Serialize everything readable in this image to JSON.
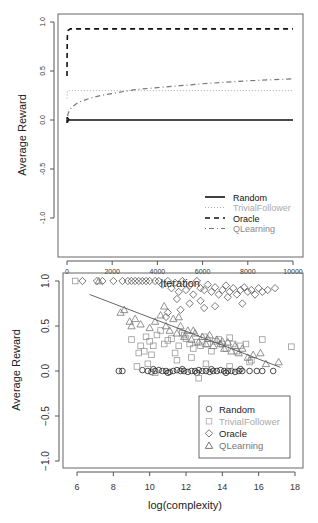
{
  "chart_data": [
    {
      "type": "line",
      "title": "",
      "xlabel": "Iteration",
      "ylabel": "Average Reward",
      "xlim": [
        0,
        10000
      ],
      "ylim": [
        -1.0,
        1.0
      ],
      "xticks": [
        0,
        2000,
        4000,
        6000,
        8000,
        10000
      ],
      "xtick_labels": [
        "0",
        "2000",
        "4000",
        "6000",
        "8000",
        "10000"
      ],
      "yticks": [
        -1.0,
        -0.5,
        0.0,
        0.5,
        1.0
      ],
      "ytick_labels": [
        "-1.0",
        "-0.5",
        "0.0",
        "0.5",
        "1.0"
      ],
      "grid": false,
      "legend_position": "bottom-right",
      "series": [
        {
          "name": "Random",
          "style": "solid",
          "color": "#111111",
          "x": [
            0,
            10,
            30,
            60,
            100,
            200,
            500,
            1000,
            2000,
            4000,
            6000,
            8000,
            10000
          ],
          "y": [
            -0.03,
            0.03,
            -0.02,
            0.01,
            0.0,
            0.0,
            0.0,
            0.0,
            0.0,
            0.0,
            0.0,
            0.0,
            0.0
          ]
        },
        {
          "name": "TrivialFollower",
          "style": "dotted",
          "color": "#aaaaaa",
          "x": [
            0,
            10,
            30,
            100,
            500,
            1000,
            2000,
            4000,
            6000,
            8000,
            10000
          ],
          "y": [
            0.22,
            0.27,
            0.3,
            0.3,
            0.3,
            0.3,
            0.3,
            0.3,
            0.3,
            0.3,
            0.3
          ]
        },
        {
          "name": "Oracle",
          "style": "dashed",
          "color": "#111111",
          "x": [
            0,
            5,
            10,
            20,
            40,
            80,
            150,
            300,
            1000,
            2000,
            4000,
            6000,
            8000,
            10000
          ],
          "y": [
            0.45,
            0.65,
            0.8,
            0.88,
            0.91,
            0.92,
            0.93,
            0.93,
            0.93,
            0.93,
            0.93,
            0.93,
            0.93,
            0.93
          ]
        },
        {
          "name": "QLearning",
          "style": "dotdash",
          "color": "#777777",
          "x": [
            0,
            50,
            200,
            500,
            1000,
            1500,
            2000,
            3000,
            4000,
            5000,
            6000,
            7000,
            8000,
            9000,
            10000
          ],
          "y": [
            0.0,
            0.07,
            0.13,
            0.18,
            0.22,
            0.25,
            0.27,
            0.31,
            0.33,
            0.35,
            0.37,
            0.385,
            0.4,
            0.41,
            0.42
          ]
        }
      ]
    },
    {
      "type": "scatter",
      "title": "",
      "xlabel": "log(complexity)",
      "ylabel": "Average Reward",
      "xlim": [
        5.5,
        18.3
      ],
      "ylim": [
        -1.0,
        1.0
      ],
      "xticks": [
        6,
        8,
        10,
        12,
        14,
        16,
        18
      ],
      "xtick_labels": [
        "6",
        "8",
        "10",
        "12",
        "14",
        "16",
        "18"
      ],
      "yticks": [
        -1.0,
        -0.5,
        0.0,
        0.5,
        1.0
      ],
      "ytick_labels": [
        "-1.0",
        "-0.5",
        "0.0",
        "0.5",
        "1.0"
      ],
      "grid": false,
      "legend_position": "bottom-right",
      "legend_boxed": true,
      "regression_line": {
        "x": [
          6.7,
          17.2
        ],
        "y": [
          0.85,
          0.04
        ]
      },
      "series": [
        {
          "name": "Random",
          "marker": "circle",
          "color": "#222222",
          "x": [
            8.3,
            8.5,
            9.6,
            9.9,
            10.1,
            10.3,
            10.5,
            10.7,
            10.9,
            11.1,
            11.3,
            11.5,
            11.7,
            11.9,
            12.1,
            12.3,
            12.5,
            12.7,
            12.9,
            13.1,
            13.3,
            13.5,
            13.7,
            13.9,
            14.1,
            14.3,
            14.5,
            14.7,
            14.9,
            15.1,
            15.5,
            15.9,
            16.2,
            16.8,
            10.2,
            11.0,
            11.8,
            12.6,
            13.4,
            14.2,
            15.0
          ],
          "y": [
            0.0,
            0.0,
            0.01,
            0.0,
            -0.01,
            0.0,
            0.01,
            0.0,
            0.0,
            -0.01,
            0.0,
            0.01,
            0.0,
            0.0,
            -0.01,
            0.0,
            0.0,
            0.01,
            0.0,
            0.0,
            -0.01,
            0.0,
            0.0,
            0.01,
            0.0,
            0.0,
            0.0,
            -0.01,
            0.0,
            0.0,
            0.0,
            0.0,
            0.0,
            0.0,
            0.02,
            -0.02,
            0.02,
            -0.02,
            0.02,
            -0.02,
            0.02
          ]
        },
        {
          "name": "TrivialFollower",
          "marker": "square",
          "color": "#999999",
          "x": [
            5.9,
            9.0,
            9.3,
            9.5,
            9.7,
            9.8,
            10.0,
            10.2,
            10.4,
            10.6,
            10.8,
            11.0,
            11.2,
            11.4,
            11.6,
            11.8,
            12.0,
            12.2,
            12.4,
            12.6,
            12.8,
            13.0,
            13.2,
            13.4,
            13.6,
            13.8,
            14.0,
            14.2,
            14.4,
            14.6,
            14.8,
            15.0,
            15.3,
            15.6,
            16.2,
            17.8,
            9.9,
            10.1,
            11.5,
            12.3,
            13.1,
            14.4,
            10.3,
            12.7,
            15.5,
            9.4,
            11.9
          ],
          "y": [
            1.0,
            0.35,
            0.05,
            0.28,
            0.22,
            0.38,
            0.33,
            0.28,
            0.4,
            0.45,
            0.3,
            0.34,
            0.36,
            0.2,
            0.28,
            0.42,
            0.36,
            0.3,
            0.25,
            0.32,
            0.28,
            0.38,
            0.3,
            0.22,
            0.33,
            0.35,
            0.3,
            0.25,
            0.37,
            0.3,
            0.22,
            0.28,
            0.3,
            0.12,
            0.35,
            0.27,
            0.08,
            0.18,
            0.12,
            0.15,
            0.08,
            0.05,
            -0.02,
            -0.08,
            0.1,
            0.2,
            0.4
          ]
        },
        {
          "name": "Oracle",
          "marker": "diamond",
          "color": "#555555",
          "x": [
            6.3,
            7.1,
            7.4,
            8.0,
            8.5,
            8.8,
            9.0,
            9.2,
            9.4,
            9.6,
            9.8,
            10.0,
            10.3,
            10.5,
            10.7,
            11.0,
            11.2,
            11.4,
            11.6,
            11.8,
            12.0,
            12.2,
            12.4,
            12.6,
            12.8,
            13.0,
            13.2,
            13.4,
            13.6,
            13.8,
            14.0,
            14.2,
            14.4,
            14.6,
            14.8,
            15.0,
            15.2,
            15.4,
            15.6,
            15.8,
            16.0,
            16.2,
            16.5,
            16.9,
            11.5,
            12.2,
            13.0,
            11.0,
            12.8,
            13.6,
            14.3,
            15.1,
            10.9,
            11.7
          ],
          "y": [
            1.0,
            1.0,
            1.0,
            1.0,
            1.0,
            1.0,
            1.0,
            1.0,
            1.0,
            1.0,
            1.0,
            1.0,
            1.0,
            1.0,
            0.96,
            1.0,
            0.92,
            0.98,
            0.88,
            1.0,
            0.9,
            0.95,
            0.85,
            1.0,
            0.92,
            0.9,
            0.96,
            0.88,
            0.93,
            0.85,
            0.9,
            0.95,
            0.88,
            0.92,
            0.85,
            0.9,
            0.93,
            0.88,
            0.9,
            0.85,
            0.92,
            0.88,
            0.9,
            0.92,
            0.8,
            0.75,
            0.7,
            0.65,
            0.78,
            0.72,
            0.82,
            0.75,
            0.6,
            0.68
          ]
        },
        {
          "name": "QLearning",
          "marker": "triangle",
          "color": "#777777",
          "x": [
            7.2,
            8.4,
            8.6,
            8.9,
            9.0,
            9.2,
            9.5,
            10.0,
            10.3,
            10.6,
            10.9,
            11.1,
            11.3,
            11.5,
            11.7,
            11.9,
            12.1,
            12.3,
            12.5,
            12.7,
            12.9,
            13.1,
            13.3,
            13.5,
            13.7,
            13.9,
            14.1,
            14.3,
            14.5,
            14.7,
            14.9,
            15.1,
            15.4,
            15.7,
            16.1,
            16.4,
            17.1,
            10.8,
            11.6,
            12.4,
            13.2,
            14.0
          ],
          "y": [
            1.0,
            0.65,
            0.68,
            0.55,
            0.5,
            0.58,
            0.52,
            0.48,
            0.55,
            0.62,
            0.5,
            0.45,
            0.58,
            0.42,
            0.5,
            0.38,
            0.45,
            0.35,
            0.42,
            0.32,
            0.38,
            0.3,
            0.4,
            0.28,
            0.35,
            0.3,
            0.25,
            0.32,
            0.22,
            0.28,
            0.2,
            0.25,
            0.15,
            0.18,
            0.2,
            0.08,
            0.1,
            0.72,
            0.6,
            0.45,
            0.36,
            0.33
          ]
        }
      ]
    }
  ]
}
